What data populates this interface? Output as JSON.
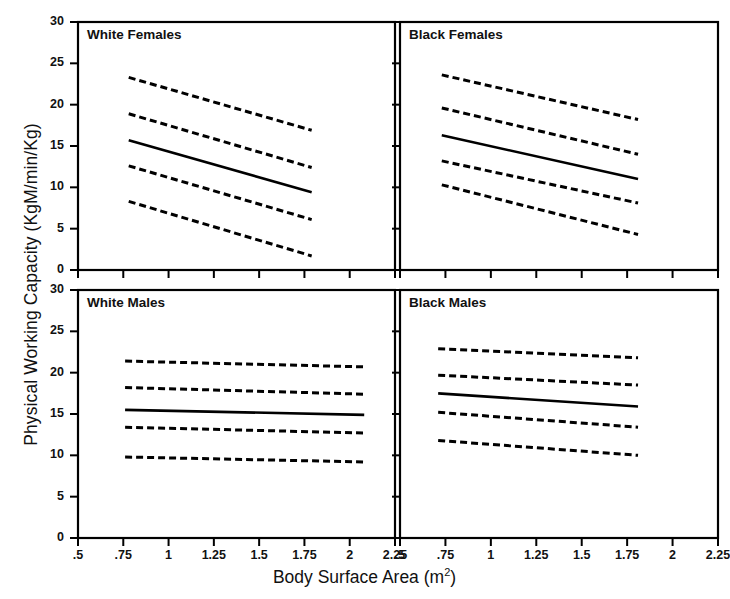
{
  "axes": {
    "ylabel": "Physical Working Capacity (KgM/min/Kg)",
    "xlabel_main": "Body Surface Area (m",
    "xlabel_sup": "2",
    "xlabel_close": ")",
    "ylim": [
      0,
      30
    ],
    "yticks": [
      0,
      5,
      10,
      15,
      20,
      25,
      30
    ],
    "ytick_labels": [
      "0",
      "5",
      "10",
      "15",
      "20",
      "25",
      "30"
    ],
    "xlim": [
      0.5,
      2.25
    ],
    "xticks": [
      0.5,
      0.75,
      1,
      1.25,
      1.5,
      1.75,
      2,
      2.25
    ],
    "xtick_labels": [
      ".5",
      ".75",
      "1",
      "1.25",
      "1.5",
      "1.75",
      "2",
      "2.25"
    ],
    "line_color": "#000000",
    "axis_color": "#000000"
  },
  "panels": [
    {
      "id": "white-females",
      "title": "White Females",
      "row": 0,
      "col": 0,
      "x_start": 0.78,
      "x_end": 1.79
    },
    {
      "id": "black-females",
      "title": "Black Females",
      "row": 0,
      "col": 1,
      "x_start": 0.73,
      "x_end": 1.81
    },
    {
      "id": "white-males",
      "title": "White Males",
      "row": 1,
      "col": 0,
      "x_start": 0.76,
      "x_end": 2.08
    },
    {
      "id": "black-males",
      "title": "Black Males",
      "row": 1,
      "col": 1,
      "x_start": 0.71,
      "x_end": 1.81
    }
  ],
  "chart_data": {
    "type": "line",
    "title": "",
    "xlabel": "Body Surface Area (m2)",
    "ylabel": "Physical Working Capacity (KgM/min/Kg)",
    "xlim": [
      0.5,
      2.25
    ],
    "ylim": [
      0,
      30
    ],
    "xticks": [
      0.5,
      0.75,
      1,
      1.25,
      1.5,
      1.75,
      2,
      2.25
    ],
    "yticks": [
      0,
      5,
      10,
      15,
      20,
      25,
      30
    ],
    "grid": false,
    "legend": "none",
    "layout": "2x2 panel grid",
    "panels": [
      {
        "name": "White Females",
        "x_range": [
          0.78,
          1.79
        ],
        "series": [
          {
            "name": "97.5th percentile",
            "style": "dashed",
            "x": [
              0.78,
              1.79
            ],
            "values": [
              23.3,
              16.9
            ]
          },
          {
            "name": "84th percentile",
            "style": "dashed",
            "x": [
              0.78,
              1.79
            ],
            "values": [
              18.9,
              12.4
            ]
          },
          {
            "name": "median",
            "style": "solid",
            "x": [
              0.78,
              1.79
            ],
            "values": [
              15.7,
              9.4
            ]
          },
          {
            "name": "16th percentile",
            "style": "dashed",
            "x": [
              0.78,
              1.79
            ],
            "values": [
              12.6,
              6.1
            ]
          },
          {
            "name": "2.5th percentile",
            "style": "dashed",
            "x": [
              0.78,
              1.79
            ],
            "values": [
              8.3,
              1.7
            ]
          }
        ]
      },
      {
        "name": "Black Females",
        "x_range": [
          0.73,
          1.81
        ],
        "series": [
          {
            "name": "97.5th percentile",
            "style": "dashed",
            "x": [
              0.73,
              1.81
            ],
            "values": [
              23.6,
              18.2
            ]
          },
          {
            "name": "84th percentile",
            "style": "dashed",
            "x": [
              0.73,
              1.81
            ],
            "values": [
              19.6,
              14.0
            ]
          },
          {
            "name": "median",
            "style": "solid",
            "x": [
              0.73,
              1.81
            ],
            "values": [
              16.3,
              11.0
            ]
          },
          {
            "name": "16th percentile",
            "style": "dashed",
            "x": [
              0.73,
              1.81
            ],
            "values": [
              13.2,
              8.1
            ]
          },
          {
            "name": "2.5th percentile",
            "style": "dashed",
            "x": [
              0.73,
              1.81
            ],
            "values": [
              10.3,
              4.3
            ]
          }
        ]
      },
      {
        "name": "White Males",
        "x_range": [
          0.76,
          2.08
        ],
        "series": [
          {
            "name": "97.5th percentile",
            "style": "dashed",
            "x": [
              0.76,
              2.08
            ],
            "values": [
              21.4,
              20.7
            ]
          },
          {
            "name": "84th percentile",
            "style": "dashed",
            "x": [
              0.76,
              2.08
            ],
            "values": [
              18.2,
              17.4
            ]
          },
          {
            "name": "median",
            "style": "solid",
            "x": [
              0.76,
              2.08
            ],
            "values": [
              15.5,
              14.9
            ]
          },
          {
            "name": "16th percentile",
            "style": "dashed",
            "x": [
              0.76,
              2.08
            ],
            "values": [
              13.4,
              12.7
            ]
          },
          {
            "name": "2.5th percentile",
            "style": "dashed",
            "x": [
              0.76,
              2.08
            ],
            "values": [
              9.8,
              9.2
            ]
          }
        ]
      },
      {
        "name": "Black Males",
        "x_range": [
          0.71,
          1.81
        ],
        "series": [
          {
            "name": "97.5th percentile",
            "style": "dashed",
            "x": [
              0.71,
              1.81
            ],
            "values": [
              22.9,
              21.8
            ]
          },
          {
            "name": "84th percentile",
            "style": "dashed",
            "x": [
              0.71,
              1.81
            ],
            "values": [
              19.7,
              18.5
            ]
          },
          {
            "name": "median",
            "style": "solid",
            "x": [
              0.71,
              1.81
            ],
            "values": [
              17.5,
              15.9
            ]
          },
          {
            "name": "16th percentile",
            "style": "dashed",
            "x": [
              0.71,
              1.81
            ],
            "values": [
              15.2,
              13.4
            ]
          },
          {
            "name": "2.5th percentile",
            "style": "dashed",
            "x": [
              0.71,
              1.81
            ],
            "values": [
              11.8,
              10.0
            ]
          }
        ]
      }
    ]
  }
}
